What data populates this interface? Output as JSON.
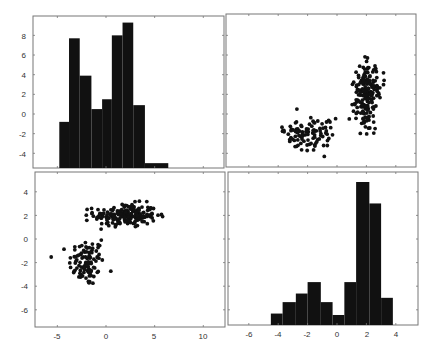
{
  "chart_data": [
    {
      "panel": "top-left",
      "type": "bar",
      "subtype": "histogram",
      "variable": "var1",
      "title": "",
      "xlabel": "",
      "ylabel": "",
      "bin_edges": [
        -4.8,
        -3.8,
        -2.7,
        -1.5,
        -0.4,
        0.6,
        1.7,
        2.8,
        4.0,
        6.4
      ],
      "bar_tops_in_y_axis_units": [
        -0.8,
        7.7,
        3.9,
        0.5,
        1.5,
        8.0,
        9.3,
        0.9,
        -5.0
      ],
      "relative_counts": [
        27,
        72,
        51,
        33,
        38,
        74,
        80,
        36,
        4
      ],
      "yticks": [
        -4,
        -2,
        0,
        2,
        4,
        6,
        8
      ],
      "ylim": [
        -5.6,
        9.8
      ],
      "grid": false
    },
    {
      "panel": "top-right",
      "type": "scatter",
      "xlabel": "var2",
      "ylabel": "var1",
      "xlim": [
        -7.4,
        5.5
      ],
      "ylim": [
        -5.4,
        10.2
      ],
      "clusters": [
        {
          "name": "cluster-1",
          "n": 100,
          "x_mean": -2.0,
          "x_sd": 1.0,
          "y_mean": -2.0,
          "y_sd": 0.9
        },
        {
          "name": "cluster-2",
          "n": 200,
          "x_mean": 2.0,
          "x_sd": 0.5,
          "y_mean": 2.0,
          "y_sd": 1.6
        }
      ],
      "grid": false
    },
    {
      "panel": "bottom-left",
      "type": "scatter",
      "xlabel": "var1",
      "ylabel": "var2",
      "xticks": [
        -5,
        0,
        5,
        10
      ],
      "yticks": [
        -6,
        -4,
        -2,
        0,
        2,
        4
      ],
      "xlim": [
        -7.3,
        12.2
      ],
      "ylim": [
        -7.45,
        5.7
      ],
      "clusters": [
        {
          "name": "cluster-1",
          "n": 100,
          "x_mean": -2.0,
          "x_sd": 0.9,
          "y_mean": -2.0,
          "y_sd": 1.0
        },
        {
          "name": "cluster-2",
          "n": 200,
          "x_mean": 2.0,
          "x_sd": 1.6,
          "y_mean": 2.0,
          "y_sd": 0.5
        }
      ],
      "grid": false
    },
    {
      "panel": "bottom-right",
      "type": "bar",
      "subtype": "histogram",
      "variable": "var2",
      "bin_edges": [
        -4.5,
        -3.7,
        -2.8,
        -2.0,
        -1.1,
        -0.3,
        0.5,
        1.3,
        2.2,
        3.0,
        3.8
      ],
      "relative_counts": [
        8,
        16,
        22,
        30,
        16,
        7,
        30,
        100,
        85,
        19
      ],
      "xticks": [
        -6,
        -4,
        -2,
        0,
        2,
        4
      ],
      "xlim": [
        -7.4,
        5.5
      ],
      "grid": false
    }
  ],
  "axes": {
    "top_left_yticks": [
      "8",
      "6",
      "4",
      "2",
      "0",
      "-2",
      "-4"
    ],
    "bottom_left_yticks": [
      "4",
      "2",
      "0",
      "-2",
      "-4",
      "-6"
    ],
    "bottom_left_xticks": [
      "-5",
      "0",
      "5",
      "10"
    ],
    "bottom_right_xticks": [
      "-6",
      "-4",
      "-2",
      "0",
      "2",
      "4"
    ]
  },
  "colors": {
    "bar": "#111111",
    "marker": "#111111",
    "frame": "#777777",
    "background": "#ffffff"
  }
}
